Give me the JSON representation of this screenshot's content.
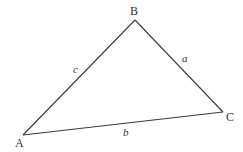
{
  "diagram": {
    "type": "triangle",
    "colors": {
      "stroke": "#3a3a3a",
      "text": "#333333",
      "background": "#ffffff"
    },
    "vertices": [
      {
        "name": "A",
        "x": 23,
        "y": 135,
        "label_x": 15,
        "label_y": 147
      },
      {
        "name": "B",
        "x": 135,
        "y": 20,
        "label_x": 130,
        "label_y": 15
      },
      {
        "name": "C",
        "x": 223,
        "y": 112,
        "label_x": 226,
        "label_y": 121
      }
    ],
    "sides": [
      {
        "name": "c",
        "from": "A",
        "to": "B",
        "label_x": 73,
        "label_y": 73
      },
      {
        "name": "a",
        "from": "B",
        "to": "C",
        "label_x": 182,
        "label_y": 62
      },
      {
        "name": "b",
        "from": "A",
        "to": "C",
        "label_x": 123,
        "label_y": 136
      }
    ]
  }
}
